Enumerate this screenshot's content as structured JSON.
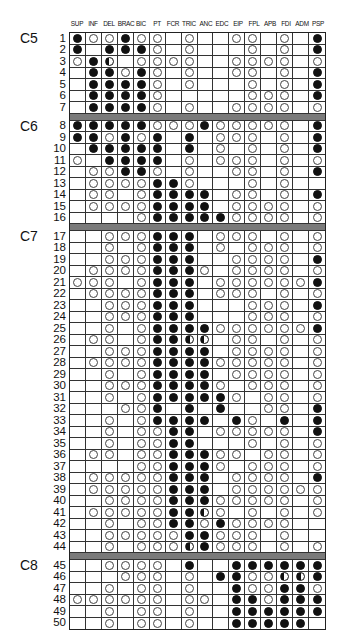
{
  "columns": [
    "SUP",
    "INF",
    "DEL",
    "BRAC",
    "BIC",
    "PT",
    "FCR",
    "TRIC",
    "ANC",
    "EDC",
    "EIP",
    "FPL",
    "APB",
    "FDI",
    "ADM",
    "PSP"
  ],
  "legend_codes": {
    "F": "filled circle",
    "O": "open circle",
    "H": "half-filled circle",
    "-": "empty"
  },
  "groups": [
    {
      "label": "C5",
      "rows": [
        {
          "n": "1",
          "cells": "FOOFOO-O--OO-O-F"
        },
        {
          "n": "2",
          "cells": "F-FFFO-O---O-O-F"
        },
        {
          "n": "3",
          "cells": "OFH-OOOO--OOOO-O"
        },
        {
          "n": "4",
          "cells": "-FFOFO-O--OO-O-F"
        },
        {
          "n": "5",
          "cells": "-FFFFO-O---O-O-F"
        },
        {
          "n": "6",
          "cells": "-FFFFO-----OOO-F"
        },
        {
          "n": "7",
          "cells": "-FFFFO-O--OOOO-O"
        }
      ]
    },
    {
      "label": "C6",
      "rows": [
        {
          "n": "8",
          "cells": "FFFFFOOOFOOOOO-F"
        },
        {
          "n": "9",
          "cells": "FFOFOF-F-OOO-O-F"
        },
        {
          "n": "10",
          "cells": "-FFFFF-F-O-O-O-F"
        },
        {
          "n": "11",
          "cells": "O-FFFF-O-OOO-O-O"
        },
        {
          "n": "12",
          "cells": "-OOFFO-O--OO-O-F"
        },
        {
          "n": "13",
          "cells": "-OOOOFFO---O-O--"
        },
        {
          "n": "14",
          "cells": "-OO-OFFFF-OO-O-F"
        },
        {
          "n": "15",
          "cells": "-OOOOFFFF-OOOO-O"
        },
        {
          "n": "16",
          "cells": "----OFFFFFOOOO-O"
        }
      ]
    },
    {
      "label": "C7",
      "rows": [
        {
          "n": "17",
          "cells": "--OOOFFF-OOO-O-O"
        },
        {
          "n": "18",
          "cells": "--O-OFFF-O-OOO-O"
        },
        {
          "n": "19",
          "cells": "--OOOFFF--OOOO-F"
        },
        {
          "n": "20",
          "cells": "-OOOOFFFO-OOOO-O"
        },
        {
          "n": "21",
          "cells": "OOO-OFFF-OOOOOOF"
        },
        {
          "n": "22",
          "cells": "-OOOOFFF-OOO-O-O"
        },
        {
          "n": "23",
          "cells": "--OOOFFF---OOO-F"
        },
        {
          "n": "24",
          "cells": "--OOOFFF---OOO-O"
        },
        {
          "n": "25",
          "cells": "--O-OFFFFOOOOOOF"
        },
        {
          "n": "26",
          "cells": "-OO-OFFHH-OO-O-O"
        },
        {
          "n": "27",
          "cells": "--OOOFFFF-OOOO-O"
        },
        {
          "n": "28",
          "cells": "-OOOOFFFFOOOOO-O"
        },
        {
          "n": "29",
          "cells": "--O-OFFFF-OOOO-O"
        },
        {
          "n": "30",
          "cells": "--OOOFFFFO-OOO-O"
        },
        {
          "n": "31",
          "cells": "--O-OFFFFFO-OO-O"
        },
        {
          "n": "32",
          "cells": "---OOF-F-F--OO-F"
        },
        {
          "n": "33",
          "cells": "--O-OFFFF-FO-F-F"
        },
        {
          "n": "34",
          "cells": "--O-OOFF-OOOOO-F"
        },
        {
          "n": "35",
          "cells": "--O-OOFF---O-O-O"
        },
        {
          "n": "36",
          "cells": "-OO-OOFFFOO-OO-O"
        },
        {
          "n": "37",
          "cells": "----OOFFFO-OOO-O"
        },
        {
          "n": "38",
          "cells": "-OOOOOFFF-OOOO-F"
        },
        {
          "n": "39",
          "cells": "-OOOOOFFF-OOOOOO"
        },
        {
          "n": "40",
          "cells": "--OOOOFFFOOOOO-O"
        },
        {
          "n": "41",
          "cells": "-OOOOOFFHO-O-O-O"
        },
        {
          "n": "42",
          "cells": "--O-OOFFOFOOOO--"
        },
        {
          "n": "43",
          "cells": "--OOOOOFFOOO-O--"
        },
        {
          "n": "44",
          "cells": "--O-OOOHFOOO-O-O"
        }
      ]
    },
    {
      "label": "C8",
      "rows": [
        {
          "n": "45",
          "cells": "--OOOO-F--FFFFFF"
        },
        {
          "n": "46",
          "cells": "---OOO-O-FFOOHHF"
        },
        {
          "n": "47",
          "cells": "--O-OO-O--FOOFFO"
        },
        {
          "n": "48",
          "cells": "OOOOOO-OO-FFOFFF"
        },
        {
          "n": "49",
          "cells": "--O-OO-O--FFFFFF"
        },
        {
          "n": "50",
          "cells": "--O-OO-O--FFFFF-"
        }
      ]
    }
  ],
  "colors": {
    "filled": "#111111",
    "separator": "#7a7a7a",
    "grid_line": "#333333"
  }
}
